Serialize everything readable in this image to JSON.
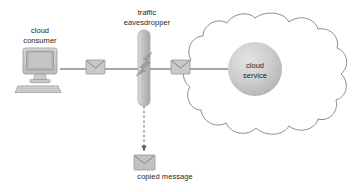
{
  "diagram": {
    "labels": {
      "cloud_consumer": "cloud\nconsumer",
      "traffic_eavesdropper": "traffic\neavesdropper",
      "cloud_service": "cloud\nservice",
      "copied_message": "copied message"
    },
    "nodes": [
      {
        "id": "cloud-consumer",
        "icon": "desktop-computer-icon",
        "label": "cloud consumer"
      },
      {
        "id": "message-envelope-1",
        "icon": "envelope-icon",
        "label": ""
      },
      {
        "id": "traffic-eavesdropper",
        "icon": "eavesdropper-bar-icon",
        "label": "traffic eavesdropper"
      },
      {
        "id": "message-envelope-2",
        "icon": "envelope-icon",
        "label": ""
      },
      {
        "id": "cloud-service",
        "icon": "cloud-service-circle-icon",
        "label": "cloud service"
      },
      {
        "id": "copied-message",
        "icon": "envelope-icon",
        "label": "copied message"
      }
    ],
    "connections": [
      {
        "from": "cloud-consumer",
        "to": "cloud-service",
        "style": "solid",
        "arrow": "end"
      },
      {
        "from": "traffic-eavesdropper",
        "to": "copied-message",
        "style": "dashed",
        "arrow": "end"
      }
    ],
    "colors": {
      "line": "#4d4d4d",
      "text": "#231f20",
      "icon_fill": "#c9c9c9",
      "icon_stroke": "#9a9a9a",
      "cloud_outline": "#8c8c8c",
      "background": "#ffffff"
    }
  }
}
